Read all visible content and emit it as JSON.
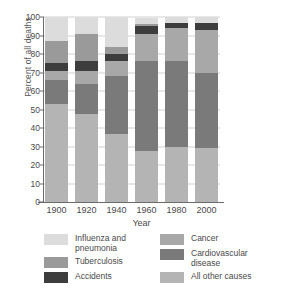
{
  "chart_data": {
    "type": "bar",
    "stacked": true,
    "title": "",
    "xlabel": "Year",
    "ylabel": "Percent of all deaths",
    "categories": [
      "1900",
      "1920",
      "1940",
      "1960",
      "1980",
      "2000"
    ],
    "ylim": [
      0,
      100
    ],
    "yticks": [
      0,
      10,
      20,
      30,
      40,
      50,
      60,
      70,
      80,
      90,
      100
    ],
    "grid": true,
    "legend_position": "below",
    "series": [
      {
        "name": "All other causes",
        "color": "#b4b4b4",
        "values": [
          53,
          47.5,
          36.5,
          27.5,
          29.5,
          29
        ]
      },
      {
        "name": "Cardiovascular disease",
        "color": "#7a7a7a",
        "values": [
          13,
          16.5,
          31.5,
          48.5,
          46.5,
          40.5
        ]
      },
      {
        "name": "Cancer",
        "color": "#a8a8a8",
        "values": [
          5,
          7,
          8,
          15,
          18,
          23.5
        ]
      },
      {
        "name": "Accidents",
        "color": "#3d3d3d",
        "values": [
          4,
          5,
          4,
          4,
          2.5,
          3.5
        ]
      },
      {
        "name": "Tuberculosis",
        "color": "#9a9a9a",
        "values": [
          12,
          15,
          4,
          1,
          0,
          0
        ]
      },
      {
        "name": "Influenza and pneumonia",
        "color": "#dcdcdc",
        "values": [
          13,
          9,
          16,
          3.5,
          3.5,
          3.5
        ]
      }
    ],
    "cumulative_tops": {
      "1900": {
        "all_other": 53,
        "cardiovascular": 66,
        "cancer": 71,
        "accidents": 75,
        "tuberculosis": 87,
        "influenza": 100
      },
      "1920": {
        "all_other": 47.5,
        "cardiovascular": 64,
        "cancer": 71,
        "accidents": 76,
        "tuberculosis": 91,
        "influenza": 100
      },
      "1940": {
        "all_other": 36.5,
        "cardiovascular": 68,
        "cancer": 76,
        "accidents": 80,
        "tuberculosis": 84,
        "influenza": 100
      },
      "1960": {
        "all_other": 27.5,
        "cardiovascular": 76,
        "cancer": 91,
        "accidents": 95,
        "tuberculosis": 96,
        "influenza": 100
      },
      "1980": {
        "all_other": 29.5,
        "cardiovascular": 76,
        "cancer": 94,
        "accidents": 96.5,
        "tuberculosis": 96.5,
        "influenza": 100
      },
      "2000": {
        "all_other": 29,
        "cardiovascular": 69.5,
        "cancer": 93,
        "accidents": 96.5,
        "tuberculosis": 96.5,
        "influenza": 100
      }
    }
  },
  "axis": {
    "y_title": "Percent of all deaths",
    "x_title": "Year",
    "y_tick_labels": [
      "100",
      "90",
      "80",
      "70",
      "60",
      "50",
      "40",
      "30",
      "20",
      "10",
      "0"
    ],
    "x_tick_labels": [
      "1900",
      "1920",
      "1940",
      "1960",
      "1980",
      "2000"
    ]
  },
  "legend": {
    "left": [
      {
        "label": "Influenza and\npneumonia",
        "color": "#dcdcdc"
      },
      {
        "label": "Tuberculosis",
        "color": "#9a9a9a"
      },
      {
        "label": "Accidents",
        "color": "#3d3d3d"
      }
    ],
    "right": [
      {
        "label": "Cancer",
        "color": "#a8a8a8"
      },
      {
        "label": "Cardiovascular\ndisease",
        "color": "#7a7a7a"
      },
      {
        "label": "All other causes",
        "color": "#b4b4b4"
      }
    ]
  }
}
